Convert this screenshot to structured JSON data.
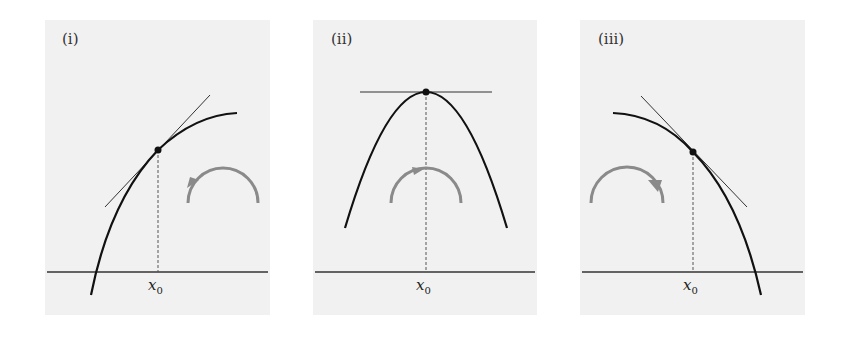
{
  "figure": {
    "panels": [
      {
        "id": "i",
        "label": "(i)",
        "x_label": "x",
        "x_sub": "0",
        "description": "increasing concave curve, tangent sloping up, rotation arrow counterclockwise"
      },
      {
        "id": "ii",
        "label": "(ii)",
        "x_label": "x",
        "x_sub": "0",
        "description": "parabola maximum at x0, horizontal tangent, rotation arrow clockwise at top"
      },
      {
        "id": "iii",
        "label": "(iii)",
        "x_label": "x",
        "x_sub": "0",
        "description": "decreasing concave curve, tangent sloping down, rotation arrow clockwise"
      }
    ],
    "colors": {
      "panel_bg": "#f1f1f1",
      "curve": "#111111",
      "tangent": "#333333",
      "axis": "#333333",
      "arrow": "#8a8a8a",
      "dashed": "#555555"
    }
  }
}
